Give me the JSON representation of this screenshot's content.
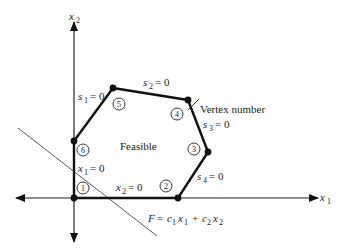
{
  "figure": {
    "axes": {
      "x_label": "x",
      "x_sub": "1",
      "y_label": "x",
      "y_sub": "2"
    },
    "region_label": "Feasible",
    "annotation": "Vertex number",
    "vertices": [
      {
        "id": "1",
        "x": 74,
        "y": 198,
        "lx": 83,
        "ly": 188
      },
      {
        "id": "2",
        "x": 178,
        "y": 198,
        "lx": 165,
        "ly": 186
      },
      {
        "id": "3",
        "x": 208,
        "y": 152,
        "lx": 194,
        "ly": 149
      },
      {
        "id": "4",
        "x": 188,
        "y": 100,
        "lx": 177,
        "ly": 113
      },
      {
        "id": "5",
        "x": 113,
        "y": 88,
        "lx": 119,
        "ly": 103
      },
      {
        "id": "6",
        "x": 74,
        "y": 141,
        "lx": 83,
        "ly": 150
      }
    ],
    "constraints": [
      {
        "var": "s",
        "sub": "1",
        "rhs": "= 0"
      },
      {
        "var": "s",
        "sub": "2",
        "rhs": "= 0"
      },
      {
        "var": "s",
        "sub": "3",
        "rhs": "= 0"
      },
      {
        "var": "s",
        "sub": "4",
        "rhs": "= 0"
      },
      {
        "var": "x",
        "sub": "1",
        "rhs": "= 0"
      },
      {
        "var": "x",
        "sub": "2",
        "rhs": "= 0"
      }
    ],
    "objective": {
      "lhs": "F",
      "eq": "=",
      "c1": "c",
      "c1_sub": "1",
      "x1": "x",
      "x1_sub": "1",
      "plus": "+",
      "c2": "c",
      "c2_sub": "2",
      "x2": "x",
      "x2_sub": "2"
    }
  }
}
